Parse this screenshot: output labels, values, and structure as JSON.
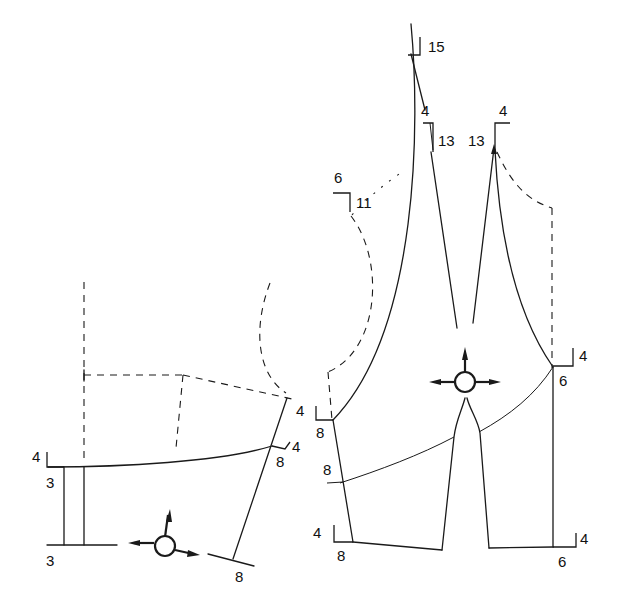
{
  "diagram": {
    "type": "garment-sewing-pattern",
    "colors": {
      "line": "#1a1a1a",
      "background": "#ffffff"
    },
    "pieces": [
      {
        "name": "left-back-piece",
        "labels": {
          "top_left_4": "4",
          "upper_left_3": "3",
          "lower_left_3": "3",
          "upper_right_4": "4",
          "mid_right_4": "4",
          "mid_right_8": "8",
          "bottom_right_8": "8"
        },
        "grainline_icon": "grain-compass-icon"
      },
      {
        "name": "right-front-piece",
        "labels": {
          "top_15": "15",
          "dart_left_4": "4",
          "dart_left_13": "13",
          "dart_right_13": "13",
          "dart_right_4": "4",
          "neck_6": "6",
          "neck_11": "11",
          "side_upper_4": "4",
          "side_upper_8": "8",
          "side_mid_4": "4",
          "side_mid_8": "8",
          "side_lower_4": "4",
          "side_lower_8": "8",
          "right_upper_4": "4",
          "right_upper_6": "6",
          "right_lower_4": "4",
          "right_lower_6": "6"
        },
        "grainline_icon": "grain-compass-icon"
      }
    ]
  }
}
